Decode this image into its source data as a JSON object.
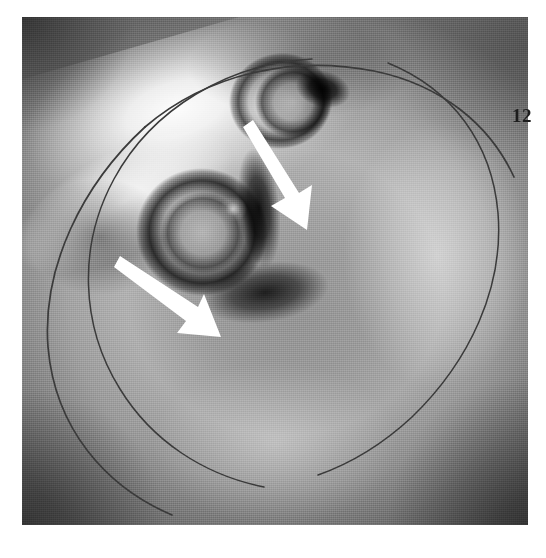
{
  "figure": {
    "domain": "medical-grayscale-topography",
    "caption_text": "",
    "plate": {
      "x": 22,
      "y": 17,
      "width": 506,
      "height": 508,
      "background_color": "#8e8e8e",
      "border_color": "#ffffff"
    }
  },
  "labels": {
    "scale_marker": "12"
  },
  "annotations": {
    "arrows": [
      {
        "name": "arrow-upper",
        "label": "",
        "color": "#ffffff",
        "tail_x": 226,
        "tail_y": 116,
        "head_x": 282,
        "head_y": 210,
        "angle_deg": 59,
        "length_px": 109,
        "shaft_width_px": 11
      },
      {
        "name": "arrow-lower",
        "label": "",
        "color": "#ffffff",
        "tail_x": 97,
        "tail_y": 259,
        "head_x": 193,
        "head_y": 327,
        "angle_deg": 35,
        "length_px": 117,
        "shaft_width_px": 11
      }
    ],
    "arcs": [
      {
        "name": "outer-arc",
        "color": "#3a3a3a",
        "center_x": 232,
        "center_y": 268,
        "radius": 218,
        "start_deg": 120,
        "end_deg": 430,
        "stroke_width": 1.6,
        "description": "outer reference circle, open on the left-upper side"
      },
      {
        "name": "inner-arc-left",
        "color": "#3a3a3a",
        "center_x": 254,
        "center_y": 262,
        "radius": 200,
        "start_deg": 118,
        "end_deg": 258,
        "stroke_width": 1.5,
        "description": "inner reference circle, left portion"
      },
      {
        "name": "inner-arc-right",
        "color": "#3a3a3a",
        "center_x": 254,
        "center_y": 262,
        "radius": 200,
        "start_deg": 282,
        "end_deg": 62,
        "stroke_width": 1.5,
        "description": "inner reference circle, right portion, gapped top and bottom"
      }
    ]
  },
  "features": {
    "dark_lesions": [
      {
        "name": "upper-lesion",
        "pointed_by": "arrow-upper"
      },
      {
        "name": "lower-lesion",
        "pointed_by": "arrow-lower"
      }
    ],
    "bright_band": {
      "name": "upper-left-bright-crescent"
    }
  }
}
